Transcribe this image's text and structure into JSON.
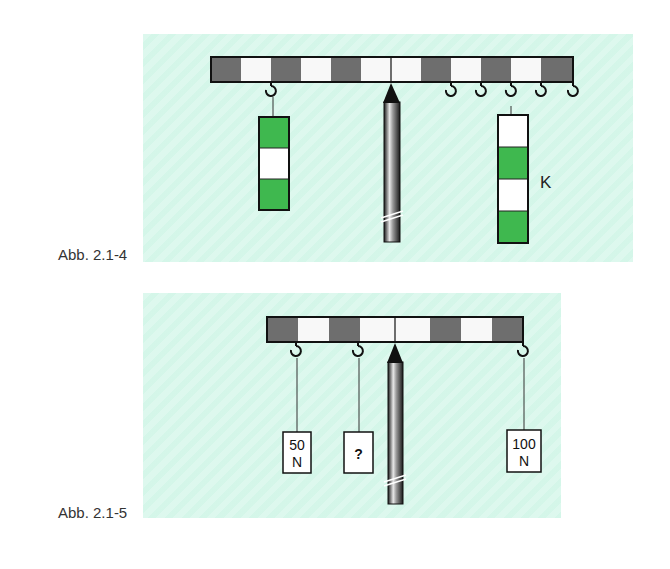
{
  "figures": [
    {
      "caption": "Abb. 2.1-4",
      "lever": {
        "segments": 12,
        "pattern": [
          "dark",
          "light",
          "dark",
          "light",
          "dark",
          "light",
          "light",
          "dark",
          "light",
          "dark",
          "light",
          "dark"
        ]
      },
      "left_weight": {
        "blocks": [
          "green",
          "white",
          "green"
        ]
      },
      "right_weight": {
        "blocks": [
          "white",
          "green",
          "white",
          "green"
        ],
        "label": "K"
      },
      "hooks_count": 6
    },
    {
      "caption": "Abb. 2.1-5",
      "lever": {
        "segments": 8,
        "pattern": [
          "dark",
          "light",
          "dark",
          "light",
          "light",
          "dark",
          "light",
          "dark"
        ]
      },
      "weights": [
        {
          "line1": "50",
          "line2": "N"
        },
        {
          "line1": "?",
          "line2": ""
        },
        {
          "line1": "100",
          "line2": "N"
        }
      ]
    }
  ],
  "colors": {
    "panel": "#d6f7ea",
    "dark_segment": "#6e6e6e",
    "light_segment": "#f8f8f8",
    "green": "#3fb84f",
    "outline": "#111111"
  }
}
